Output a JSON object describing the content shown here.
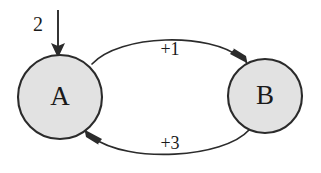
{
  "diagram": {
    "type": "state-transition-diagram",
    "background_color": "#ffffff",
    "stroke_color": "#2b2b2b",
    "node_fill_color": "#e2e2e2",
    "nodes": [
      {
        "id": "A",
        "label": "A",
        "cx": 60,
        "cy": 97,
        "r": 42,
        "fill": "#e2e2e2"
      },
      {
        "id": "B",
        "label": "B",
        "cx": 265,
        "cy": 96,
        "r": 37,
        "fill": "#e2e2e2"
      }
    ],
    "edges": [
      {
        "id": "a-to-b",
        "from": "A",
        "to": "B",
        "label": "+1",
        "label_x": 170,
        "label_y": 51,
        "direction": "top-arc-rightward"
      },
      {
        "id": "b-to-a",
        "from": "B",
        "to": "A",
        "label": "+3",
        "label_x": 170,
        "label_y": 145,
        "direction": "bottom-arc-leftward"
      }
    ],
    "input_arrow": {
      "id": "input-into-a",
      "label": "2",
      "label_x": 38,
      "label_y": 26,
      "target": "A",
      "from_x": 58,
      "from_y": 10,
      "to_x": 58,
      "to_y": 56
    }
  }
}
